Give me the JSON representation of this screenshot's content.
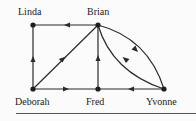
{
  "diagram": {
    "type": "directed-graph",
    "nodes": [
      {
        "id": "linda",
        "label": "Linda",
        "x": 33,
        "y": 25
      },
      {
        "id": "brian",
        "label": "Brian",
        "x": 98,
        "y": 25
      },
      {
        "id": "deborah",
        "label": "Deborah",
        "x": 33,
        "y": 89
      },
      {
        "id": "fred",
        "label": "Fred",
        "x": 98,
        "y": 89
      },
      {
        "id": "yvonne",
        "label": "Yvonne",
        "x": 164,
        "y": 89
      }
    ],
    "edges": [
      {
        "from": "brian",
        "to": "linda"
      },
      {
        "from": "deborah",
        "to": "linda"
      },
      {
        "from": "deborah",
        "to": "brian"
      },
      {
        "from": "deborah",
        "to": "fred"
      },
      {
        "from": "fred",
        "to": "brian"
      },
      {
        "from": "yvonne",
        "to": "fred"
      },
      {
        "from": "brian",
        "to": "yvonne",
        "curve": "upper"
      },
      {
        "from": "yvonne",
        "to": "brian",
        "curve": "lower"
      }
    ],
    "colors": {
      "line": "#2a2a2a",
      "text": "#222222",
      "background": "#fbfbfb"
    }
  },
  "labels": {
    "linda": "Linda",
    "brian": "Brian",
    "deborah": "Deborah",
    "fred": "Fred",
    "yvonne": "Yvonne"
  }
}
